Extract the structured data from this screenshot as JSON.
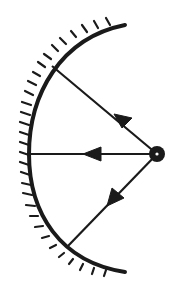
{
  "diagram": {
    "colors": {
      "background": "#ffffff",
      "ink": "#1a1a1a"
    },
    "mirror": {
      "type": "concave",
      "top_end": [
        125,
        25
      ],
      "bottom_end": [
        125,
        272
      ],
      "vertex": [
        29,
        154
      ],
      "hatching": "outer side (left)"
    },
    "source": {
      "type": "point-source",
      "position": [
        157,
        154
      ],
      "symbol": "circle-with-dot"
    },
    "rays": [
      {
        "name": "upper-ray",
        "from": [
          157,
          154
        ],
        "to": [
          52,
          66
        ],
        "arrow_direction": "toward-mirror"
      },
      {
        "name": "axial-ray",
        "from": [
          157,
          154
        ],
        "to": [
          30,
          154
        ],
        "arrow_direction": "toward-mirror"
      },
      {
        "name": "lower-ray",
        "from": [
          157,
          154
        ],
        "to": [
          67,
          247
        ],
        "arrow_direction": "toward-mirror"
      }
    ]
  }
}
